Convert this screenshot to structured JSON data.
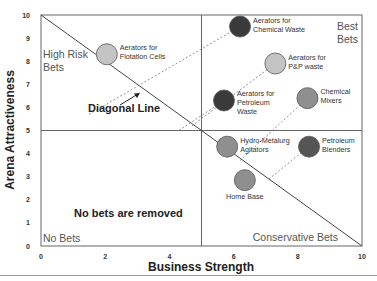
{
  "chart_data": {
    "type": "scatter",
    "title": "",
    "xlabel": "Business Strength",
    "ylabel": "Arena Attractiveness",
    "xlim": [
      0,
      10
    ],
    "ylim": [
      0,
      10
    ],
    "x_ticks": [
      "0",
      "2",
      "4",
      "6",
      "8",
      "10"
    ],
    "y_ticks": [
      "0",
      "1",
      "2",
      "3",
      "4",
      "5",
      "6",
      "7",
      "8",
      "9",
      "10"
    ],
    "grid": false,
    "divider_lines": {
      "x": 5,
      "y": 5
    },
    "diagonal_line": {
      "from": [
        0,
        10
      ],
      "to": [
        10,
        0
      ],
      "label": "Diagonal Line"
    },
    "quadrant_labels": {
      "top_left": "High Risk Bets",
      "top_right": "Best Bets",
      "bottom_left": "No Bets",
      "bottom_right": "Conservative Bets"
    },
    "annotation": "No bets are removed",
    "points": [
      {
        "label": "Aerators for Flotation Cells",
        "line1": "Aerators for",
        "line2": "Flotation Cells",
        "line3": "",
        "x": 2.05,
        "y": 8.3,
        "color": "#c4c4c4"
      },
      {
        "label": "Aerators for Chemical Waste",
        "line1": "Aerators for",
        "line2": "Chemical Waste",
        "line3": "",
        "x": 6.2,
        "y": 9.5,
        "color": "#3a3a3a"
      },
      {
        "label": "Aerators for P&P waste",
        "line1": "Aerators for",
        "line2": "P&P waste",
        "line3": "",
        "x": 7.3,
        "y": 7.9,
        "color": "#c4c4c4"
      },
      {
        "label": "Aerators for Petroleum Waste",
        "line1": "Aerators for",
        "line2": "Petroleum",
        "line3": "Waste",
        "x": 5.7,
        "y": 6.3,
        "color": "#3a3a3a"
      },
      {
        "label": "Chemical Mixers",
        "line1": "Chemical",
        "line2": "Mixers",
        "line3": "",
        "x": 8.3,
        "y": 6.4,
        "color": "#8f8f8f"
      },
      {
        "label": "Hydro-Metalurg Agitators",
        "line1": "Hydro-Metalurg",
        "line2": "Agitators",
        "line3": "",
        "x": 5.8,
        "y": 4.3,
        "color": "#8f8f8f"
      },
      {
        "label": "Petroleum Blenders",
        "line1": "Petroleum",
        "line2": "Blenders",
        "line3": "",
        "x": 8.35,
        "y": 4.3,
        "color": "#555555"
      },
      {
        "label": "Home Base",
        "line1": "Home Base",
        "line2": "",
        "line3": "",
        "x": 6.35,
        "y": 2.85,
        "color": "#8f8f8f"
      }
    ],
    "dashed_connectors": [
      {
        "from": [
          1.5,
          5.7
        ],
        "to": [
          6.2,
          9.5
        ]
      },
      {
        "from": [
          4.7,
          5.2
        ],
        "to": [
          7.3,
          7.9
        ]
      },
      {
        "from": [
          4.3,
          5.0
        ],
        "to": [
          5.7,
          6.3
        ]
      },
      {
        "from": [
          6.2,
          3.7
        ],
        "to": [
          8.3,
          6.4
        ]
      },
      {
        "from": [
          5.7,
          4.3
        ],
        "to": [
          5.8,
          4.3
        ]
      },
      {
        "from": [
          7.1,
          2.9
        ],
        "to": [
          8.35,
          4.3
        ]
      }
    ]
  }
}
